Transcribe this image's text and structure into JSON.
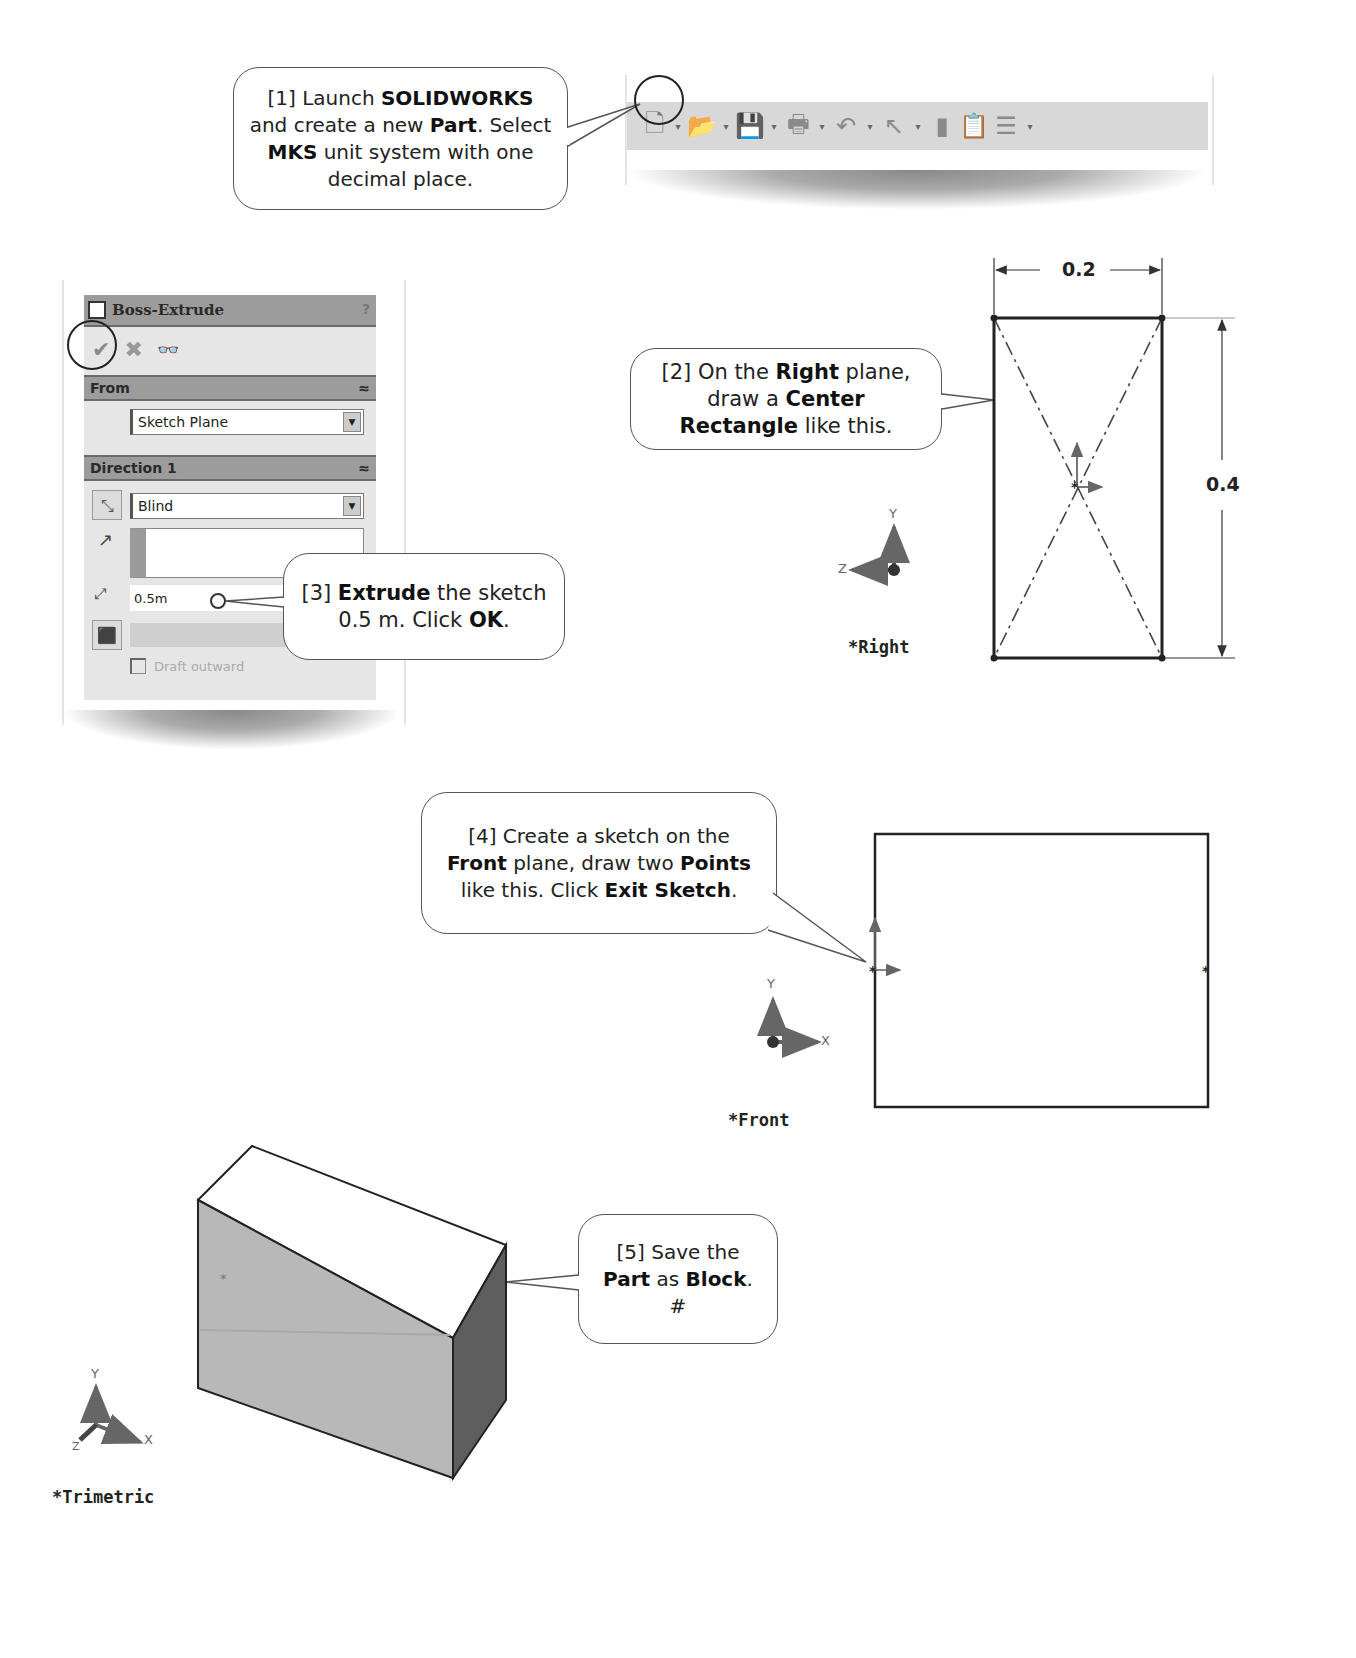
{
  "steps": [
    {
      "id": 1,
      "parts": [
        {
          "t": "[1] Launch ",
          "b": false
        },
        {
          "t": "SOLIDWORKS",
          "b": true
        },
        {
          "t": " and create a new ",
          "b": false
        },
        {
          "t": "Part",
          "b": true
        },
        {
          "t": ".  Select ",
          "b": false
        },
        {
          "t": "MKS",
          "b": true
        },
        {
          "t": " unit system with one decimal place.",
          "b": false
        }
      ]
    },
    {
      "id": 2,
      "parts": [
        {
          "t": "[2] On the ",
          "b": false
        },
        {
          "t": "Right",
          "b": true
        },
        {
          "t": " plane, draw a ",
          "b": false
        },
        {
          "t": "Center Rectangle",
          "b": true
        },
        {
          "t": " like this.",
          "b": false
        }
      ]
    },
    {
      "id": 3,
      "parts": [
        {
          "t": "[3] ",
          "b": false
        },
        {
          "t": "Extrude",
          "b": true
        },
        {
          "t": " the sketch 0.5 m.  Click ",
          "b": false
        },
        {
          "t": "OK",
          "b": true
        },
        {
          "t": ".",
          "b": false
        }
      ]
    },
    {
      "id": 4,
      "parts": [
        {
          "t": "[4] Create a sketch on the ",
          "b": false
        },
        {
          "t": "Front",
          "b": true
        },
        {
          "t": " plane, draw two ",
          "b": false
        },
        {
          "t": "Points",
          "b": true
        },
        {
          "t": " like this. Click ",
          "b": false
        },
        {
          "t": "Exit Sketch",
          "b": true
        },
        {
          "t": ".",
          "b": false
        }
      ]
    },
    {
      "id": 5,
      "parts": [
        {
          "t": "[5] Save the ",
          "b": false
        },
        {
          "t": "Part",
          "b": true
        },
        {
          "t": " as ",
          "b": false
        },
        {
          "t": "Block",
          "b": true
        },
        {
          "t": ". #",
          "b": false
        }
      ]
    }
  ],
  "toolbar": {
    "icons": [
      "new-document",
      "open-folder",
      "save",
      "print",
      "undo",
      "select-pointer",
      "rebuild",
      "file-properties",
      "options"
    ],
    "glyphs": {
      "new": "🗋",
      "open": "📂",
      "save": "💾",
      "print": "🖶",
      "undo": "↶",
      "select": "↖",
      "rebuild": "▮",
      "props": "📋",
      "options": "☰",
      "caret": "▾"
    }
  },
  "property_manager": {
    "title": "Boss-Extrude",
    "help": "?",
    "ok_glyph": "✔",
    "cancel_glyph": "✖",
    "preview_glyph": "👓",
    "from_section": "From",
    "from_value": "Sketch Plane",
    "direction_section": "Direction 1",
    "end_condition": "Blind",
    "depth_value": "0.5m",
    "draft_label": "Draft outward",
    "collapse_glyph": "≈",
    "dropdown_glyph": "▼"
  },
  "right_view": {
    "label": "*Right",
    "width_dim": "0.2",
    "height_dim": "0.4",
    "axis_y": "Y",
    "axis_z": "Z"
  },
  "front_view": {
    "label": "*Front",
    "axis_y": "Y",
    "axis_x": "X"
  },
  "trimetric_view": {
    "label": "*Trimetric",
    "axis_y": "Y",
    "axis_x": "X",
    "axis_z": "Z"
  },
  "colors": {
    "callout_border": "#555555",
    "panel_header": "#9c9c9c",
    "panel_bg": "#e6e6e6",
    "block_front": "#b8b8b8",
    "block_side": "#5e5e5e",
    "block_top": "#ffffff"
  }
}
